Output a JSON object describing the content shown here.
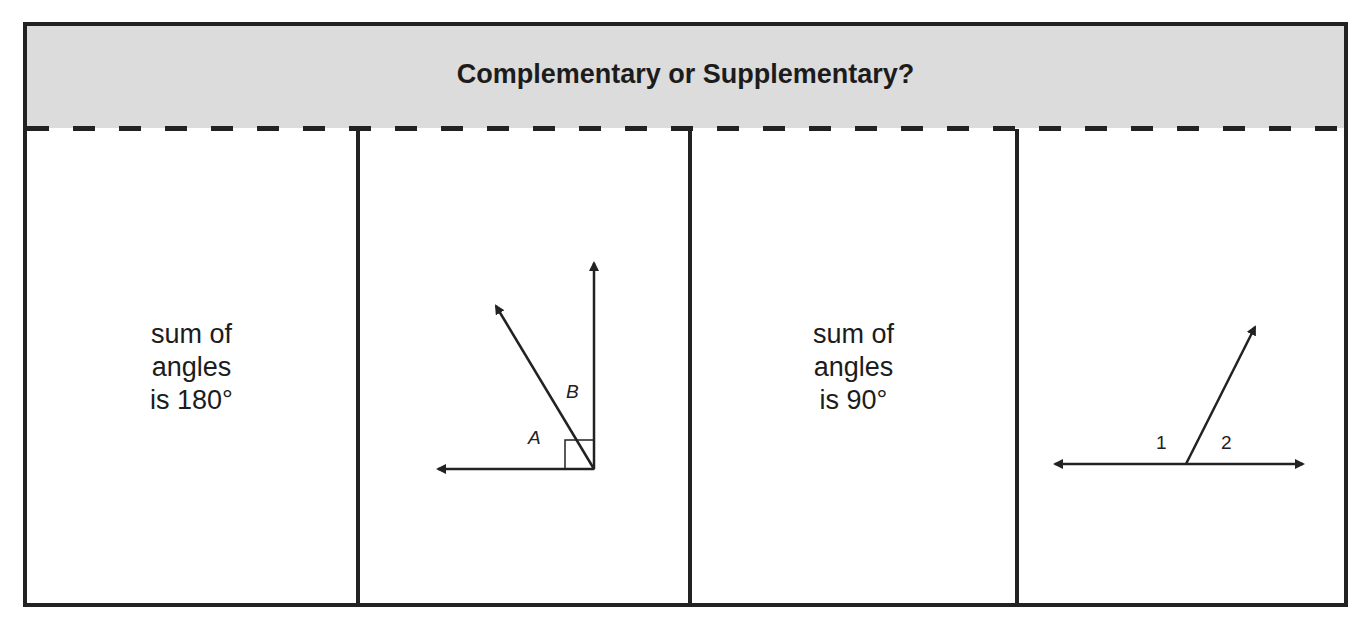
{
  "title": "Complementary or Supplementary?",
  "cells": [
    {
      "type": "text",
      "lines": [
        "sum of",
        "angles",
        "is 180°"
      ]
    },
    {
      "type": "figure",
      "name": "complementary-angles-figure",
      "labels": [
        "A",
        "B"
      ],
      "right_angle_marker": true
    },
    {
      "type": "text",
      "lines": [
        "sum of",
        "angles",
        "is 90°"
      ]
    },
    {
      "type": "figure",
      "name": "supplementary-angles-figure",
      "labels": [
        "1",
        "2"
      ]
    }
  ]
}
